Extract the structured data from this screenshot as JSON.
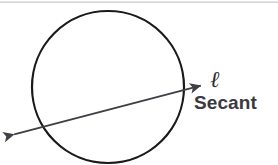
{
  "figure": {
    "kind": "geometry-diagram",
    "background_color": "#ffffff",
    "width": 278,
    "height": 165,
    "labels": {
      "line_name": "ℓ",
      "concept": "Secant"
    },
    "colors": {
      "circle_stroke": "#1a1a1a",
      "secant_stroke": "#3f3f45",
      "arrowhead_fill": "#3f3f45",
      "label_text": "#3a3a40",
      "line_name_text": "#2e2e33",
      "top_rule": "#c9c9cc"
    },
    "circle": {
      "center_x": 108,
      "center_y": 87,
      "radius": 76,
      "stroke_width": 2.2,
      "fill": "none"
    },
    "secant": {
      "start_x": 8,
      "start_y": 136,
      "end_x": 207,
      "end_y": 84,
      "stroke_width": 2.0,
      "arrow_start": true,
      "arrow_end": true,
      "intersections": [
        {
          "x": 40,
          "y": 128
        },
        {
          "x": 181,
          "y": 91
        }
      ]
    },
    "top_rule": {
      "x1": 0,
      "y1": 2,
      "x2": 278,
      "y2": 2,
      "stroke_width": 1.2
    }
  }
}
